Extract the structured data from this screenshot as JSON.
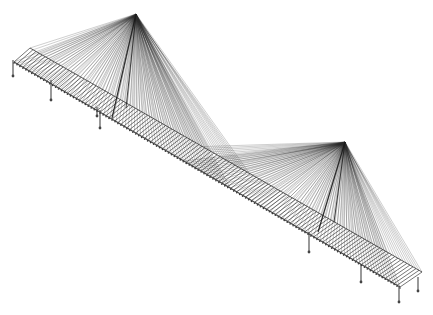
{
  "diagram": {
    "type": "wireframe-structure",
    "background": "#ffffff",
    "line_color": "#1a1a1a",
    "cable_color": "#2a2a2a",
    "deck_color": "#333333",
    "pier_color": "#444444",
    "deck": {
      "front_edge_start": [
        14,
        62
      ],
      "front_edge_end": [
        400,
        287
      ],
      "back_edge_start": [
        30,
        48
      ],
      "back_edge_end": [
        422,
        272
      ],
      "beam_count": 130
    },
    "pylons": [
      {
        "id": "left-pylon",
        "top": [
          136,
          14
        ],
        "base_front": [
          112,
          118
        ],
        "base_back": [
          126,
          108
        ],
        "span_from": 0.0,
        "span_to": 0.56
      },
      {
        "id": "right-pylon",
        "top": [
          345,
          142
        ],
        "base_front": [
          318,
          232
        ],
        "base_back": [
          334,
          222
        ],
        "span_from": 0.44,
        "span_to": 1.0
      }
    ],
    "piers": [
      {
        "x": 13,
        "y_top": 60,
        "y_bottom": 76
      },
      {
        "x": 51,
        "y_top": 80,
        "y_bottom": 100
      },
      {
        "x": 97,
        "y_top": 107,
        "y_bottom": 116
      },
      {
        "x": 100,
        "y_top": 110,
        "y_bottom": 128
      },
      {
        "x": 309,
        "y_top": 232,
        "y_bottom": 252
      },
      {
        "x": 361,
        "y_top": 264,
        "y_bottom": 282
      },
      {
        "x": 399,
        "y_top": 287,
        "y_bottom": 302
      },
      {
        "x": 418,
        "y_top": 277,
        "y_bottom": 291
      }
    ],
    "cables_per_pylon": 70
  }
}
